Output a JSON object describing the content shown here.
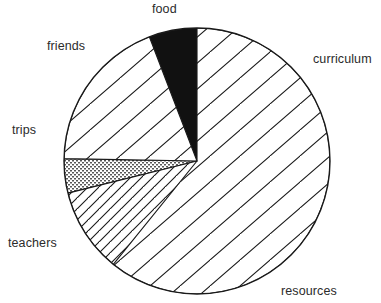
{
  "chart_data": {
    "type": "pie",
    "title": "",
    "subtitle": "",
    "xlabel": "",
    "ylabel": "",
    "legend_position": "none",
    "grid": false,
    "labels_placement": "outside-around-pie",
    "start_angle_deg": 0,
    "direction": "clockwise",
    "center": {
      "x": 197,
      "y": 161
    },
    "radius": 133,
    "categories": [
      "curriculum",
      "resources",
      "teachers",
      "trips",
      "friends",
      "food"
    ],
    "values": [
      27.5,
      28.3,
      19.5,
      4.2,
      14.7,
      5.8
    ],
    "units": "percent",
    "slices": [
      {
        "label": "curriculum",
        "value": 27.5,
        "start_angle_deg": 0,
        "end_angle_deg": 99,
        "fill_pattern": "diagonal-hatch-up",
        "fill_color": "#ffffff",
        "line_color": "#1a1a1a"
      },
      {
        "label": "resources",
        "value": 28.3,
        "start_angle_deg": 99,
        "end_angle_deg": 201,
        "fill_pattern": "diamond-crosshatch-wide",
        "fill_color": "#ffffff",
        "line_color": "#1a1a1a"
      },
      {
        "label": "teachers",
        "value": 19.5,
        "start_angle_deg": 201,
        "end_angle_deg": 271,
        "fill_pattern": "fine-stipple-dots",
        "fill_color": "#ffffff",
        "line_color": "#4a4a4a"
      },
      {
        "label": "trips",
        "value": 4.2,
        "start_angle_deg": 271,
        "end_angle_deg": 256,
        "fill_pattern": "sparse-diamond-outline",
        "fill_color": "#ffffff",
        "line_color": "#1a1a1a"
      },
      {
        "label": "friends",
        "value": 14.7,
        "start_angle_deg": 219,
        "end_angle_deg": 256,
        "fill_pattern": "dense-crosshatch",
        "fill_color": "#ffffff",
        "line_color": "#1a1a1a"
      },
      {
        "label": "food",
        "value": 5.8,
        "start_angle_deg": 339,
        "end_angle_deg": 360,
        "fill_pattern": "solid",
        "fill_color": "#111111",
        "line_color": "#111111"
      }
    ]
  },
  "labels": {
    "food": {
      "text": "food",
      "x": 152,
      "y": 3
    },
    "curriculum": {
      "text": "curriculum",
      "x": 313,
      "y": 53
    },
    "friends": {
      "text": "friends",
      "x": 47,
      "y": 40
    },
    "trips": {
      "text": "trips",
      "x": 12,
      "y": 124
    },
    "teachers": {
      "text": "teachers",
      "x": 8,
      "y": 237
    },
    "resources": {
      "text": "resources",
      "x": 281,
      "y": 285
    }
  },
  "colors": {
    "background": "#ffffff",
    "ink": "#1a1a1a",
    "label_text": "#2b2b2b",
    "food_slice": "#111111"
  }
}
